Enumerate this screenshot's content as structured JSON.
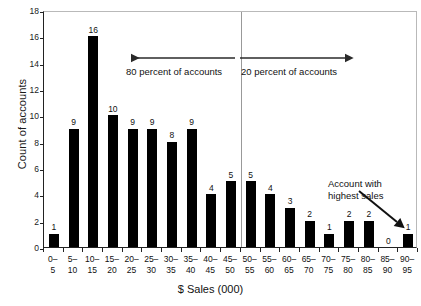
{
  "chart_data": {
    "type": "bar",
    "title": "",
    "xlabel": "$ Sales (000)",
    "ylabel": "Count of accounts",
    "ylim": [
      0,
      18
    ],
    "ytick_step": 2,
    "yticks": [
      0,
      2,
      4,
      6,
      8,
      10,
      12,
      14,
      16,
      18
    ],
    "grid": false,
    "legend": "none",
    "bar_color": "#000000",
    "categories": [
      "0–5",
      "5–10",
      "10–15",
      "15–20",
      "20–25",
      "25–30",
      "30–35",
      "35–40",
      "40–45",
      "45–50",
      "50–55",
      "55–60",
      "60–65",
      "65–70",
      "70–75",
      "75–80",
      "80–85",
      "85–90",
      "90–95"
    ],
    "category_lines": [
      [
        "0–",
        "5"
      ],
      [
        "5–",
        "10"
      ],
      [
        "10–",
        "15"
      ],
      [
        "15–",
        "20"
      ],
      [
        "20–",
        "25"
      ],
      [
        "25–",
        "30"
      ],
      [
        "30–",
        "35"
      ],
      [
        "35–",
        "40"
      ],
      [
        "40–",
        "45"
      ],
      [
        "45–",
        "50"
      ],
      [
        "50–",
        "55"
      ],
      [
        "55–",
        "60"
      ],
      [
        "60–",
        "65"
      ],
      [
        "65–",
        "70"
      ],
      [
        "70–",
        "75"
      ],
      [
        "75–",
        "80"
      ],
      [
        "80–",
        "85"
      ],
      [
        "85–",
        "90"
      ],
      [
        "90–",
        "95"
      ]
    ],
    "values": [
      1,
      9,
      16,
      10,
      9,
      9,
      8,
      9,
      4,
      5,
      5,
      4,
      3,
      2,
      1,
      2,
      2,
      0,
      1
    ],
    "data_labels": [
      "1",
      "9",
      "16",
      "10",
      "9",
      "9",
      "8",
      "9",
      "4",
      "5",
      "5",
      "4",
      "3",
      "2",
      "1",
      "2",
      "2",
      "0",
      "1"
    ]
  },
  "annotations": {
    "left_span_label": "80 percent of accounts",
    "right_span_label": "20 percent of accounts",
    "callout_line1": "Account with",
    "callout_line2": "highest sales",
    "divider_after_category_index": 9
  },
  "style": {
    "bar_color": "#000000",
    "axis_color": "#222222",
    "frame_color": "#b9b9b9",
    "divider_color": "#999999",
    "text_color": "#111111"
  }
}
